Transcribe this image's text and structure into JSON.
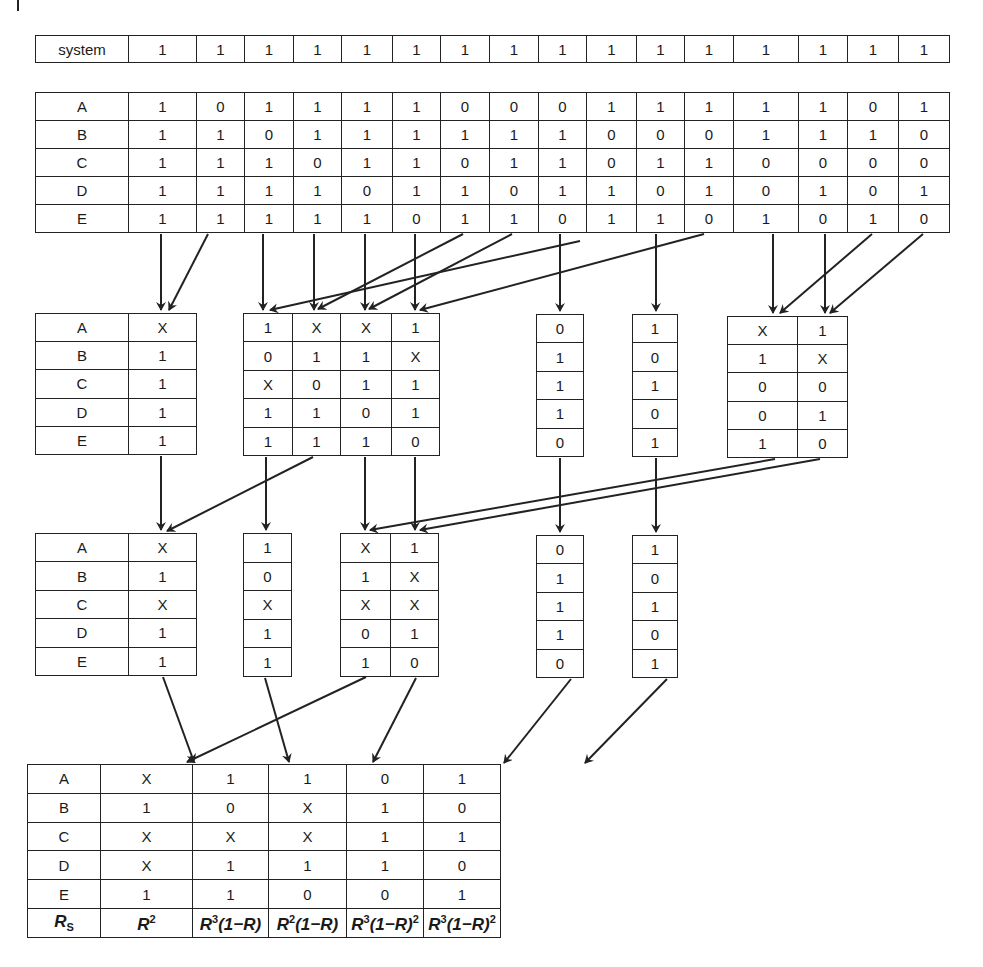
{
  "diagram": {
    "system_row": {
      "label": "system",
      "values": [
        "1",
        "1",
        "1",
        "1",
        "1",
        "1",
        "1",
        "1",
        "1",
        "1",
        "1",
        "1",
        "1",
        "1",
        "1",
        "1"
      ]
    },
    "states_table": {
      "rows": [
        {
          "label": "A",
          "values": [
            "1",
            "0",
            "1",
            "1",
            "1",
            "1",
            "0",
            "0",
            "0",
            "1",
            "1",
            "1",
            "1",
            "1",
            "0",
            "1"
          ]
        },
        {
          "label": "B",
          "values": [
            "1",
            "1",
            "0",
            "1",
            "1",
            "1",
            "1",
            "1",
            "1",
            "0",
            "0",
            "0",
            "1",
            "1",
            "1",
            "0"
          ]
        },
        {
          "label": "C",
          "values": [
            "1",
            "1",
            "1",
            "0",
            "1",
            "1",
            "0",
            "1",
            "1",
            "0",
            "1",
            "1",
            "0",
            "0",
            "0",
            "0"
          ]
        },
        {
          "label": "D",
          "values": [
            "1",
            "1",
            "1",
            "1",
            "0",
            "1",
            "1",
            "0",
            "1",
            "1",
            "0",
            "1",
            "0",
            "1",
            "0",
            "1"
          ]
        },
        {
          "label": "E",
          "values": [
            "1",
            "1",
            "1",
            "1",
            "1",
            "0",
            "1",
            "1",
            "0",
            "1",
            "1",
            "0",
            "1",
            "0",
            "1",
            "0"
          ]
        }
      ]
    },
    "level2": {
      "group1": {
        "labels": [
          "A",
          "B",
          "C",
          "D",
          "E"
        ],
        "values": [
          "X",
          "1",
          "1",
          "1",
          "1"
        ]
      },
      "group2": {
        "rows": [
          [
            "1",
            "X",
            "X",
            "1"
          ],
          [
            "0",
            "1",
            "1",
            "X"
          ],
          [
            "X",
            "0",
            "1",
            "1"
          ],
          [
            "1",
            "1",
            "0",
            "1"
          ],
          [
            "1",
            "1",
            "1",
            "0"
          ]
        ]
      },
      "group3": {
        "values": [
          "0",
          "1",
          "1",
          "1",
          "0"
        ]
      },
      "group4": {
        "values": [
          "1",
          "0",
          "1",
          "0",
          "1"
        ]
      },
      "group5": {
        "rows": [
          [
            "X",
            "1"
          ],
          [
            "1",
            "X"
          ],
          [
            "0",
            "0"
          ],
          [
            "0",
            "1"
          ],
          [
            "1",
            "0"
          ]
        ]
      }
    },
    "level3": {
      "group1": {
        "labels": [
          "A",
          "B",
          "C",
          "D",
          "E"
        ],
        "values": [
          "X",
          "1",
          "X",
          "1",
          "1"
        ]
      },
      "group2": {
        "values": [
          "1",
          "0",
          "X",
          "1",
          "1"
        ]
      },
      "group3": {
        "rows": [
          [
            "X",
            "1"
          ],
          [
            "1",
            "X"
          ],
          [
            "X",
            "X"
          ],
          [
            "0",
            "1"
          ],
          [
            "1",
            "0"
          ]
        ]
      },
      "group4": {
        "values": [
          "0",
          "1",
          "1",
          "1",
          "0"
        ]
      },
      "group5": {
        "values": [
          "1",
          "0",
          "1",
          "0",
          "1"
        ]
      }
    },
    "result_table": {
      "rows": [
        {
          "label": "A",
          "values": [
            "X",
            "1",
            "1",
            "0",
            "1"
          ]
        },
        {
          "label": "B",
          "values": [
            "1",
            "0",
            "X",
            "1",
            "0"
          ]
        },
        {
          "label": "C",
          "values": [
            "X",
            "X",
            "X",
            "1",
            "1"
          ]
        },
        {
          "label": "D",
          "values": [
            "X",
            "1",
            "1",
            "1",
            "0"
          ]
        },
        {
          "label": "E",
          "values": [
            "1",
            "1",
            "0",
            "0",
            "1"
          ]
        }
      ],
      "footer": {
        "label_base": "R",
        "label_sub": "S",
        "formulas": [
          {
            "base": "R",
            "exp": "2",
            "tail": "",
            "tail_exp": ""
          },
          {
            "base": "R",
            "exp": "3",
            "tail": "(1−R)",
            "tail_exp": ""
          },
          {
            "base": "R",
            "exp": "2",
            "tail": "(1−R)",
            "tail_exp": ""
          },
          {
            "base": "R",
            "exp": "3",
            "tail": "(1−R)",
            "tail_exp": "2"
          },
          {
            "base": "R",
            "exp": "3",
            "tail": "(1−R)",
            "tail_exp": "2"
          }
        ]
      }
    }
  },
  "colors": {
    "line": "#222222",
    "background": "#ffffff"
  }
}
